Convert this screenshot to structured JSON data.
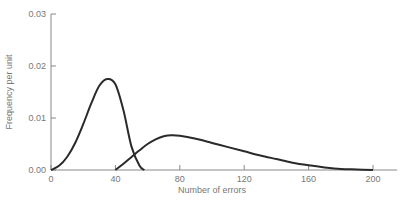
{
  "chart_data": {
    "type": "line",
    "title": "",
    "xlabel": "Number of errors",
    "ylabel": "Frequency per unit",
    "xlim": [
      0,
      215
    ],
    "ylim": [
      0,
      0.03
    ],
    "x_ticks": [
      0,
      40,
      80,
      120,
      160,
      200
    ],
    "x_tick_labels": [
      "0",
      "40",
      "80",
      "120",
      "160",
      "200"
    ],
    "y_ticks": [
      0,
      0.01,
      0.02,
      0.03
    ],
    "y_tick_labels": [
      "0.00",
      "0.01",
      "0.02",
      "0.03"
    ],
    "grid": false,
    "legend": null,
    "series": [
      {
        "name": "Distribution A",
        "x": [
          0,
          5,
          10,
          15,
          20,
          25,
          30,
          35,
          40,
          45,
          50,
          55,
          58
        ],
        "y": [
          0,
          0.0008,
          0.0025,
          0.0052,
          0.0088,
          0.0128,
          0.0162,
          0.0175,
          0.0165,
          0.0115,
          0.0045,
          0.0008,
          0
        ]
      },
      {
        "name": "Distribution B",
        "x": [
          40,
          45,
          50,
          55,
          60,
          65,
          70,
          75,
          80,
          90,
          100,
          110,
          120,
          130,
          140,
          150,
          160,
          170,
          180,
          190,
          200
        ],
        "y": [
          0,
          0.0012,
          0.0025,
          0.0038,
          0.005,
          0.0059,
          0.0065,
          0.0067,
          0.0066,
          0.006,
          0.0052,
          0.0044,
          0.0036,
          0.0028,
          0.0021,
          0.0014,
          0.0009,
          0.0005,
          0.0002,
          0.0001,
          0
        ]
      }
    ]
  },
  "colors": {
    "line": "#2a2a2a",
    "axis": "#888888",
    "text": "#777777"
  }
}
